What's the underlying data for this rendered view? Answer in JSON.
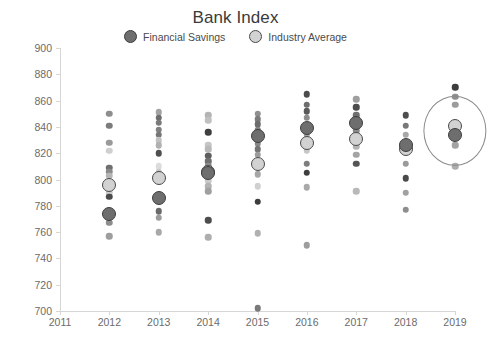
{
  "chart_data": {
    "type": "scatter",
    "title": "Bank Index",
    "xlabel": "",
    "ylabel": "",
    "xlim": [
      2011,
      2019
    ],
    "ylim": [
      700,
      900
    ],
    "ytick_step": 20,
    "grid": false,
    "legend_position": "top-center",
    "x_ticks": [
      "2011",
      "2012",
      "2013",
      "2014",
      "2015",
      "2016",
      "2017",
      "2018",
      "2019"
    ],
    "y_ticks": [
      "700",
      "720",
      "740",
      "760",
      "780",
      "800",
      "820",
      "840",
      "860",
      "880",
      "900"
    ],
    "legend": [
      {
        "name": "Financial Savings",
        "color": "#6e6e6e",
        "marker": "filled-circle"
      },
      {
        "name": "Industry Average",
        "color": "#d2d2d2",
        "marker": "open-circle"
      }
    ],
    "annotations": [
      {
        "type": "ellipse",
        "label": "highlight-2019",
        "x": 2019,
        "y_center": 837,
        "y_span": 26,
        "x_span": 0.62
      }
    ],
    "series": [
      {
        "name": "Financial Savings",
        "marker": "large-dark-circle",
        "points": [
          {
            "x": 2012,
            "y": 774
          },
          {
            "x": 2013,
            "y": 786
          },
          {
            "x": 2014,
            "y": 805
          },
          {
            "x": 2015,
            "y": 833
          },
          {
            "x": 2016,
            "y": 839
          },
          {
            "x": 2017,
            "y": 843
          },
          {
            "x": 2018,
            "y": 826
          },
          {
            "x": 2019,
            "y": 834
          }
        ]
      },
      {
        "name": "Industry Average",
        "marker": "large-light-circle",
        "points": [
          {
            "x": 2012,
            "y": 796
          },
          {
            "x": 2013,
            "y": 801
          },
          {
            "x": 2014,
            "y": 806
          },
          {
            "x": 2015,
            "y": 812
          },
          {
            "x": 2016,
            "y": 828
          },
          {
            "x": 2017,
            "y": 831
          },
          {
            "x": 2018,
            "y": 823
          },
          {
            "x": 2019,
            "y": 841
          }
        ]
      },
      {
        "name": "Background Banks",
        "marker": "small-gray-circle",
        "points": [
          {
            "x": 2012,
            "y": 850,
            "shade": "#8e8e8e"
          },
          {
            "x": 2012,
            "y": 841,
            "shade": "#7c7c7c"
          },
          {
            "x": 2012,
            "y": 828,
            "shade": "#9a9a9a"
          },
          {
            "x": 2012,
            "y": 822,
            "shade": "#cfcfcf"
          },
          {
            "x": 2012,
            "y": 809,
            "shade": "#6f6f6f"
          },
          {
            "x": 2012,
            "y": 806,
            "shade": "#8a8a8a"
          },
          {
            "x": 2012,
            "y": 803,
            "shade": "#b5b5b5"
          },
          {
            "x": 2012,
            "y": 790,
            "shade": "#cccccc"
          },
          {
            "x": 2012,
            "y": 787,
            "shade": "#4a4a4a"
          },
          {
            "x": 2012,
            "y": 767,
            "shade": "#8d8d8d"
          },
          {
            "x": 2012,
            "y": 757,
            "shade": "#9e9e9e"
          },
          {
            "x": 2013,
            "y": 851,
            "shade": "#a2a2a2"
          },
          {
            "x": 2013,
            "y": 847,
            "shade": "#6d6d6d"
          },
          {
            "x": 2013,
            "y": 843,
            "shade": "#7a7a7a"
          },
          {
            "x": 2013,
            "y": 838,
            "shade": "#808080"
          },
          {
            "x": 2013,
            "y": 834,
            "shade": "#767676"
          },
          {
            "x": 2013,
            "y": 830,
            "shade": "#c2c2c2"
          },
          {
            "x": 2013,
            "y": 826,
            "shade": "#b0b0b0"
          },
          {
            "x": 2013,
            "y": 820,
            "shade": "#4f4f4f"
          },
          {
            "x": 2013,
            "y": 810,
            "shade": "#dcdcdc"
          },
          {
            "x": 2013,
            "y": 806,
            "shade": "#c8c8c8"
          },
          {
            "x": 2013,
            "y": 776,
            "shade": "#6a6a6a"
          },
          {
            "x": 2013,
            "y": 771,
            "shade": "#9c9c9c"
          },
          {
            "x": 2013,
            "y": 760,
            "shade": "#a8a8a8"
          },
          {
            "x": 2014,
            "y": 849,
            "shade": "#b4b4b4"
          },
          {
            "x": 2014,
            "y": 845,
            "shade": "#c0c0c0"
          },
          {
            "x": 2014,
            "y": 836,
            "shade": "#3f3f3f"
          },
          {
            "x": 2014,
            "y": 826,
            "shade": "#c5c5c5"
          },
          {
            "x": 2014,
            "y": 823,
            "shade": "#b8b8b8"
          },
          {
            "x": 2014,
            "y": 818,
            "shade": "#5e5e5e"
          },
          {
            "x": 2014,
            "y": 814,
            "shade": "#707070"
          },
          {
            "x": 2014,
            "y": 810,
            "shade": "#8b8b8b"
          },
          {
            "x": 2014,
            "y": 799,
            "shade": "#c9c9c9"
          },
          {
            "x": 2014,
            "y": 795,
            "shade": "#b2b2b2"
          },
          {
            "x": 2014,
            "y": 791,
            "shade": "#a0a0a0"
          },
          {
            "x": 2014,
            "y": 769,
            "shade": "#4d4d4d"
          },
          {
            "x": 2014,
            "y": 756,
            "shade": "#aeaeae"
          },
          {
            "x": 2015,
            "y": 850,
            "shade": "#8f8f8f"
          },
          {
            "x": 2015,
            "y": 846,
            "shade": "#7b7b7b"
          },
          {
            "x": 2015,
            "y": 842,
            "shade": "#6c6c6c"
          },
          {
            "x": 2015,
            "y": 838,
            "shade": "#808080"
          },
          {
            "x": 2015,
            "y": 827,
            "shade": "#888888"
          },
          {
            "x": 2015,
            "y": 823,
            "shade": "#747474"
          },
          {
            "x": 2015,
            "y": 819,
            "shade": "#9b9b9b"
          },
          {
            "x": 2015,
            "y": 804,
            "shade": "#a6a6a6"
          },
          {
            "x": 2015,
            "y": 795,
            "shade": "#d0d0d0"
          },
          {
            "x": 2015,
            "y": 783,
            "shade": "#3c3c3c"
          },
          {
            "x": 2015,
            "y": 759,
            "shade": "#b0b0b0"
          },
          {
            "x": 2015,
            "y": 702,
            "shade": "#7a7a7a"
          },
          {
            "x": 2016,
            "y": 865,
            "shade": "#4b4b4b"
          },
          {
            "x": 2016,
            "y": 857,
            "shade": "#6e6e6e"
          },
          {
            "x": 2016,
            "y": 852,
            "shade": "#5a5a5a"
          },
          {
            "x": 2016,
            "y": 847,
            "shade": "#8c8c8c"
          },
          {
            "x": 2016,
            "y": 834,
            "shade": "#a5a5a5"
          },
          {
            "x": 2016,
            "y": 822,
            "shade": "#c6c6c6"
          },
          {
            "x": 2016,
            "y": 812,
            "shade": "#7d7d7d"
          },
          {
            "x": 2016,
            "y": 805,
            "shade": "#3e3e3e"
          },
          {
            "x": 2016,
            "y": 794,
            "shade": "#a9a9a9"
          },
          {
            "x": 2016,
            "y": 750,
            "shade": "#9d9d9d"
          },
          {
            "x": 2017,
            "y": 861,
            "shade": "#9f9f9f"
          },
          {
            "x": 2017,
            "y": 855,
            "shade": "#4c4c4c"
          },
          {
            "x": 2017,
            "y": 849,
            "shade": "#6f6f6f"
          },
          {
            "x": 2017,
            "y": 837,
            "shade": "#8a8a8a"
          },
          {
            "x": 2017,
            "y": 825,
            "shade": "#b3b3b3"
          },
          {
            "x": 2017,
            "y": 819,
            "shade": "#a4a4a4"
          },
          {
            "x": 2017,
            "y": 812,
            "shade": "#555555"
          },
          {
            "x": 2017,
            "y": 791,
            "shade": "#b9b9b9"
          },
          {
            "x": 2018,
            "y": 849,
            "shade": "#4e4e4e"
          },
          {
            "x": 2018,
            "y": 841,
            "shade": "#787878"
          },
          {
            "x": 2018,
            "y": 834,
            "shade": "#a7a7a7"
          },
          {
            "x": 2018,
            "y": 812,
            "shade": "#9a9a9a"
          },
          {
            "x": 2018,
            "y": 801,
            "shade": "#4a4a4a"
          },
          {
            "x": 2018,
            "y": 790,
            "shade": "#a1a1a1"
          },
          {
            "x": 2018,
            "y": 777,
            "shade": "#8e8e8e"
          },
          {
            "x": 2019,
            "y": 870,
            "shade": "#3d3d3d"
          },
          {
            "x": 2019,
            "y": 863,
            "shade": "#8f8f8f"
          },
          {
            "x": 2019,
            "y": 857,
            "shade": "#9c9c9c"
          },
          {
            "x": 2019,
            "y": 826,
            "shade": "#a3a3a3"
          },
          {
            "x": 2019,
            "y": 810,
            "shade": "#adadad"
          }
        ]
      }
    ]
  }
}
